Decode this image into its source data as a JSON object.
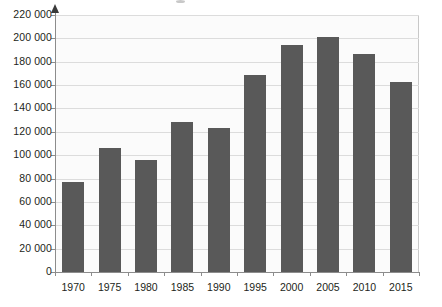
{
  "chart_data": {
    "type": "bar",
    "title": "",
    "subtitle": "",
    "xlabel": "",
    "ylabel": "",
    "categories": [
      "1970",
      "1975",
      "1980",
      "1985",
      "1990",
      "1995",
      "2000",
      "2005",
      "2010",
      "2015"
    ],
    "values": [
      77000,
      106000,
      96000,
      128000,
      123000,
      169000,
      194000,
      201000,
      187000,
      163000
    ],
    "series": [
      {
        "name": "",
        "values": [
          77000,
          106000,
          96000,
          128000,
          123000,
          169000,
          194000,
          201000,
          187000,
          163000
        ]
      }
    ],
    "ylim": [
      0,
      220000
    ],
    "ytick_values": [
      0,
      20000,
      40000,
      60000,
      80000,
      100000,
      120000,
      140000,
      160000,
      180000,
      200000,
      220000
    ],
    "ytick_labels": [
      "0",
      "20 000",
      "40 000",
      "60 000",
      "80 000",
      "100 000",
      "120 000",
      "140 000",
      "160 000",
      "180 000",
      "200 000",
      "220 000"
    ],
    "xtick_labels": [
      "1970",
      "1975",
      "1980",
      "1985",
      "1990",
      "1995",
      "2000",
      "2005",
      "2010",
      "2015"
    ],
    "grid": "horizontal",
    "legend": "none",
    "bar_color": "#595959",
    "plot_background": "#fbfbfb",
    "gridline_color": "#dcdcdc",
    "axis_color": "#8c8c8c",
    "text_color": "#231f20",
    "y_axis_has_arrow": true,
    "annotations": []
  }
}
